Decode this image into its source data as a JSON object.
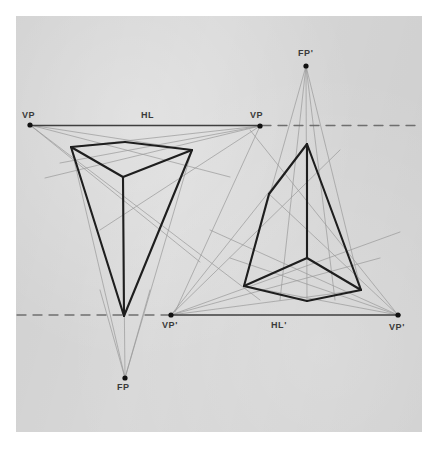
{
  "figure": {
    "kind": "technical-drawing",
    "paper_color": "#d7d7d7",
    "ink_color": "#1e1e1e",
    "construction_color": "#9a9a9a",
    "canvas": {
      "width": 438,
      "height": 454
    },
    "paper": {
      "x": 16,
      "y": 16,
      "width": 406,
      "height": 416
    }
  },
  "labels": [
    {
      "id": "vp-left",
      "text": "VP",
      "x": 22,
      "y": 110
    },
    {
      "id": "hl",
      "text": "HL",
      "x": 141,
      "y": 110
    },
    {
      "id": "vp-right",
      "text": "VP",
      "x": 250,
      "y": 110
    },
    {
      "id": "fp-prime",
      "text": "FP'",
      "x": 298,
      "y": 48
    },
    {
      "id": "vp-prime-left",
      "text": "VP'",
      "x": 162,
      "y": 320
    },
    {
      "id": "hl-prime",
      "text": "HL'",
      "x": 271,
      "y": 320
    },
    {
      "id": "vp-prime-right",
      "text": "VP'",
      "x": 389,
      "y": 322
    },
    {
      "id": "fp",
      "text": "FP",
      "x": 117,
      "y": 382
    }
  ],
  "points": [
    {
      "id": "vp-left-point",
      "x": 30,
      "y": 125
    },
    {
      "id": "vp-right-point",
      "x": 260,
      "y": 126
    },
    {
      "id": "fp-prime-point",
      "x": 306,
      "y": 66
    },
    {
      "id": "vp-prime-left-point",
      "x": 171,
      "y": 315
    },
    {
      "id": "vp-prime-right-point",
      "x": 398,
      "y": 315
    },
    {
      "id": "fp-point",
      "x": 125,
      "y": 378
    }
  ],
  "chart_data": {
    "type": "diagram",
    "horizon_lines": [
      {
        "id": "HL",
        "label": "HL",
        "y": 125.5,
        "solid_from_x": 30,
        "solid_to_x": 262,
        "dashed_segments": [
          [
            262,
            422
          ]
        ],
        "vanishing_points": [
          {
            "name": "VP",
            "x": 30,
            "y": 125
          },
          {
            "name": "VP",
            "x": 260,
            "y": 126
          }
        ]
      },
      {
        "id": "HL_prime",
        "label": "HL'",
        "y": 315,
        "solid_from_x": 171,
        "solid_to_x": 400,
        "dashed_segments": [
          [
            17,
            171
          ]
        ],
        "vanishing_points": [
          {
            "name": "VP'",
            "x": 171,
            "y": 315
          },
          {
            "name": "VP'",
            "x": 398,
            "y": 315
          }
        ]
      }
    ],
    "focal_points": [
      {
        "name": "FP",
        "x": 125,
        "y": 378
      },
      {
        "name": "FP'",
        "x": 306,
        "y": 66
      }
    ],
    "solids": [
      {
        "id": "upper-prism",
        "note": "Triangular prism seen from above, apex of vertical edge pointing down to HL'",
        "vertices": {
          "top_left": [
            71,
            147
          ],
          "top_back": [
            125,
            142
          ],
          "top_right": [
            192,
            150
          ],
          "top_front": [
            123,
            177
          ],
          "bottom_point": [
            124,
            316
          ]
        },
        "edges": [
          [
            "top_left",
            "top_back"
          ],
          [
            "top_back",
            "top_right"
          ],
          [
            "top_left",
            "top_front"
          ],
          [
            "top_right",
            "top_front"
          ],
          [
            "top_front",
            "bottom_point"
          ],
          [
            "top_left",
            "bottom_point"
          ],
          [
            "top_right",
            "bottom_point"
          ]
        ]
      },
      {
        "id": "lower-prism",
        "note": "Triangular prism seen from below, apex of vertical edge pointing up to HL",
        "vertices": {
          "apex": [
            307,
            144
          ],
          "left_upper": [
            269,
            194
          ],
          "bottom_left": [
            244,
            286
          ],
          "bottom_front": [
            307,
            301
          ],
          "bottom_right": [
            361,
            290
          ],
          "bottom_center": [
            307,
            258
          ]
        },
        "edges": [
          [
            "apex",
            "left_upper"
          ],
          [
            "left_upper",
            "bottom_left"
          ],
          [
            "apex",
            "bottom_right"
          ],
          [
            "bottom_left",
            "bottom_front"
          ],
          [
            "bottom_front",
            "bottom_right"
          ],
          [
            "apex",
            "bottom_center"
          ],
          [
            "bottom_center",
            "bottom_left"
          ],
          [
            "bottom_center",
            "bottom_right"
          ]
        ]
      }
    ],
    "construction_lines": [
      {
        "from": [
          30,
          125
        ],
        "to": [
          192,
          150
        ]
      },
      {
        "from": [
          30,
          125
        ],
        "to": [
          230,
          177
        ]
      },
      {
        "from": [
          30,
          125
        ],
        "to": [
          200,
          262
        ]
      },
      {
        "from": [
          30,
          125
        ],
        "to": [
          260,
          300
        ]
      },
      {
        "from": [
          260,
          126
        ],
        "to": [
          71,
          147
        ]
      },
      {
        "from": [
          260,
          126
        ],
        "to": [
          60,
          163
        ]
      },
      {
        "from": [
          260,
          126
        ],
        "to": [
          45,
          178
        ]
      },
      {
        "from": [
          260,
          126
        ],
        "to": [
          100,
          230
        ]
      },
      {
        "from": [
          260,
          126
        ],
        "to": [
          175,
          312
        ]
      },
      {
        "from": [
          125,
          378
        ],
        "to": [
          71,
          147
        ]
      },
      {
        "from": [
          125,
          378
        ],
        "to": [
          192,
          150
        ]
      },
      {
        "from": [
          125,
          378
        ],
        "to": [
          123,
          177
        ]
      },
      {
        "from": [
          125,
          378
        ],
        "to": [
          150,
          290
        ]
      },
      {
        "from": [
          125,
          378
        ],
        "to": [
          100,
          290
        ]
      },
      {
        "from": [
          306,
          66
        ],
        "to": [
          244,
          286
        ]
      },
      {
        "from": [
          306,
          66
        ],
        "to": [
          361,
          290
        ]
      },
      {
        "from": [
          306,
          66
        ],
        "to": [
          307,
          301
        ]
      },
      {
        "from": [
          306,
          66
        ],
        "to": [
          280,
          300
        ]
      },
      {
        "from": [
          306,
          66
        ],
        "to": [
          335,
          300
        ]
      },
      {
        "from": [
          171,
          315
        ],
        "to": [
          307,
          144
        ]
      },
      {
        "from": [
          171,
          315
        ],
        "to": [
          340,
          150
        ]
      },
      {
        "from": [
          171,
          315
        ],
        "to": [
          361,
          290
        ]
      },
      {
        "from": [
          171,
          315
        ],
        "to": [
          380,
          258
        ]
      },
      {
        "from": [
          171,
          315
        ],
        "to": [
          400,
          232
        ]
      },
      {
        "from": [
          398,
          315
        ],
        "to": [
          269,
          194
        ]
      },
      {
        "from": [
          398,
          315
        ],
        "to": [
          244,
          286
        ]
      },
      {
        "from": [
          398,
          315
        ],
        "to": [
          230,
          258
        ]
      },
      {
        "from": [
          398,
          315
        ],
        "to": [
          210,
          230
        ]
      },
      {
        "from": [
          398,
          315
        ],
        "to": [
          250,
          130
        ]
      }
    ]
  }
}
